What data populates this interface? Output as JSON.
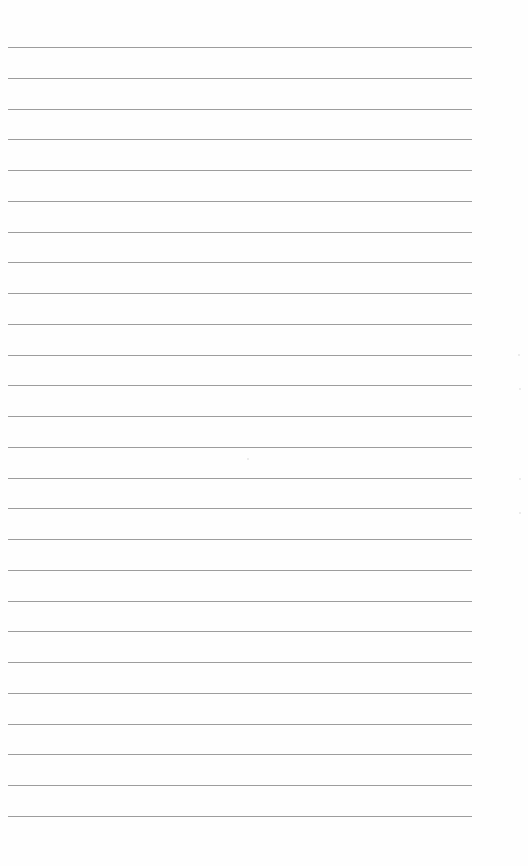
{
  "document": {
    "type": "lined-paper",
    "line_count": 26,
    "line_color": "#8c8c8c",
    "background_color": "#fefefe",
    "text": ""
  }
}
